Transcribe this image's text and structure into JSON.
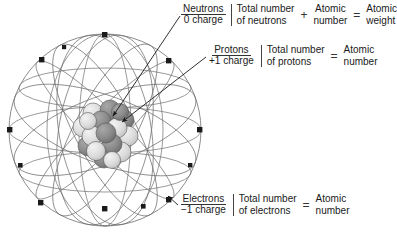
{
  "diagram": {
    "colors": {
      "orbit_line": "#6e6e6e",
      "sphere_outline": "#6e6e6e",
      "electron": "#1a1a1a",
      "proton_sphere": "#8a8a8a",
      "neutron_sphere": "#d9d9d9",
      "nucleus_outline": "#555555",
      "arrow": "#1a1a1a",
      "text": "#1a1a1a",
      "background": "#ffffff"
    },
    "atom": {
      "electron_count": 12,
      "nucleus_particle_count": 17,
      "orbit_count": 7
    }
  },
  "rows": {
    "neutrons": {
      "particle": "Neutrons",
      "charge": "0 charge",
      "count_line1": "Total number",
      "count_line2": "of neutrons",
      "operator": "+",
      "term2_line1": "Atomic",
      "term2_line2": "number",
      "equals": "=",
      "result_line1": "Atomic",
      "result_line2": "weight"
    },
    "protons": {
      "particle": "Protons",
      "charge": "+1 charge",
      "count_line1": "Total number",
      "count_line2": "of protons",
      "equals": "=",
      "result_line1": "Atomic",
      "result_line2": "number"
    },
    "electrons": {
      "particle": "Electrons",
      "charge": "−1 charge",
      "count_line1": "Total number",
      "count_line2": "of electrons",
      "equals": "=",
      "result_line1": "Atomic",
      "result_line2": "number"
    }
  }
}
